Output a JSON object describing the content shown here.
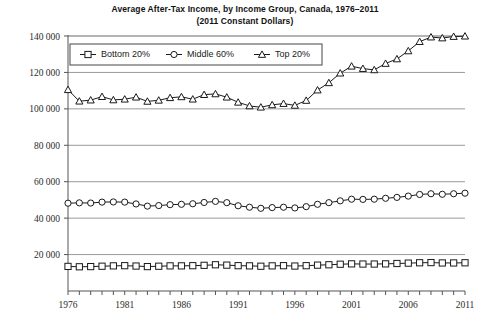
{
  "chart_data": {
    "type": "line",
    "title": "Average After-Tax Income, by Income Group, Canada, 1976–2011",
    "subtitle": "(2011 Constant Dollars)",
    "xlabel": "",
    "ylabel": "",
    "x": [
      1976,
      1977,
      1978,
      1979,
      1980,
      1981,
      1982,
      1983,
      1984,
      1985,
      1986,
      1987,
      1988,
      1989,
      1990,
      1991,
      1992,
      1993,
      1994,
      1995,
      1996,
      1997,
      1998,
      1999,
      2000,
      2001,
      2002,
      2003,
      2004,
      2005,
      2006,
      2007,
      2008,
      2009,
      2010,
      2011
    ],
    "xlim": [
      1976,
      2011
    ],
    "ylim": [
      0,
      140000
    ],
    "y_ticks": [
      20000,
      40000,
      60000,
      80000,
      100000,
      120000,
      140000
    ],
    "y_tick_labels": [
      "20 000",
      "40 000",
      "60 000",
      "80 000",
      "100 000",
      "120 000",
      "140 000"
    ],
    "x_tick_labels": [
      "1976",
      "1981",
      "1986",
      "1991",
      "1996",
      "2001",
      "2006",
      "2011"
    ],
    "x_tick_values": [
      1976,
      1981,
      1986,
      1991,
      1996,
      2001,
      2006,
      2011
    ],
    "grid": "horizontal",
    "legend_position": "top-left-inside",
    "series": [
      {
        "name": "Bottom 20%",
        "marker": "square",
        "color": "#1a1a1a",
        "values": [
          13500,
          13300,
          13400,
          13600,
          13800,
          13900,
          13700,
          13400,
          13600,
          13800,
          13800,
          13900,
          14100,
          14400,
          14200,
          13900,
          13800,
          13600,
          13800,
          13900,
          13700,
          13900,
          14200,
          14400,
          14700,
          14900,
          14800,
          14800,
          14900,
          15100,
          15300,
          15500,
          15600,
          15400,
          15400,
          15500
        ]
      },
      {
        "name": "Middle 60%",
        "marker": "circle",
        "color": "#1a1a1a",
        "values": [
          48200,
          48400,
          48300,
          48800,
          48900,
          48800,
          47800,
          46600,
          46900,
          47400,
          47600,
          47900,
          48600,
          49200,
          48500,
          46800,
          46000,
          45400,
          45800,
          46000,
          45600,
          46300,
          47600,
          48500,
          49500,
          50400,
          50300,
          50400,
          50900,
          51400,
          52100,
          53000,
          53400,
          53100,
          53400,
          53700
        ]
      },
      {
        "name": "Top 20%",
        "marker": "triangle",
        "color": "#1a1a1a",
        "values": [
          110500,
          104200,
          104800,
          106700,
          104900,
          105300,
          106400,
          104100,
          104700,
          106100,
          106600,
          105300,
          107800,
          108200,
          106400,
          103600,
          101600,
          100900,
          102200,
          102900,
          101900,
          104600,
          110300,
          114300,
          119600,
          123400,
          122100,
          121400,
          124900,
          127400,
          131800,
          136900,
          139400,
          138900,
          139700,
          139900
        ]
      }
    ]
  }
}
